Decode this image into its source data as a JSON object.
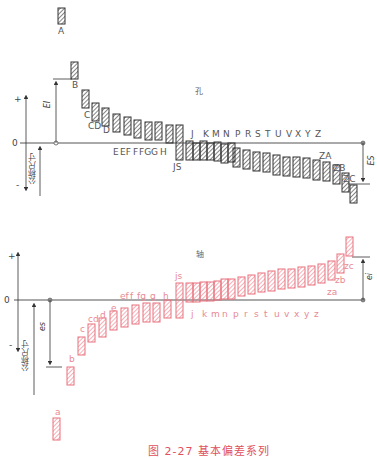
{
  "caption": "图 2-27  基本偏差系列",
  "colors": {
    "hole": "#333333",
    "shaft": "#e8707c",
    "axis": "#444444"
  },
  "hole_section": {
    "title": "孔",
    "zero_label": "0",
    "plus_label": "+",
    "minus_label": "-",
    "nominal_size_label": "公称尺寸",
    "EI_label": "EI",
    "ES_label": "ES",
    "zero_line_y": 143,
    "labels": [
      {
        "text": "A",
        "x": 58,
        "y": 27
      },
      {
        "text": "B",
        "x": 72,
        "y": 81
      },
      {
        "text": "C",
        "x": 84,
        "y": 111
      },
      {
        "text": "CD",
        "x": 88,
        "y": 122
      },
      {
        "text": "D",
        "x": 103,
        "y": 126
      },
      {
        "text": "E",
        "x": 113,
        "y": 148
      },
      {
        "text": "EF",
        "x": 120,
        "y": 148
      },
      {
        "text": "F",
        "x": 133,
        "y": 148
      },
      {
        "text": "FG",
        "x": 139,
        "y": 148
      },
      {
        "text": "G",
        "x": 151,
        "y": 148
      },
      {
        "text": "H",
        "x": 160,
        "y": 148
      },
      {
        "text": "JS",
        "x": 173,
        "y": 163
      },
      {
        "text": "J",
        "x": 191,
        "y": 130
      },
      {
        "text": "K",
        "x": 203,
        "y": 130
      },
      {
        "text": "M",
        "x": 212,
        "y": 130
      },
      {
        "text": "N",
        "x": 223,
        "y": 130
      },
      {
        "text": "P",
        "x": 235,
        "y": 130
      },
      {
        "text": "R",
        "x": 245,
        "y": 130
      },
      {
        "text": "S",
        "x": 255,
        "y": 130
      },
      {
        "text": "T",
        "x": 265,
        "y": 130
      },
      {
        "text": "U",
        "x": 275,
        "y": 130
      },
      {
        "text": "V",
        "x": 286,
        "y": 130
      },
      {
        "text": "X",
        "x": 295,
        "y": 130
      },
      {
        "text": "Y",
        "x": 305,
        "y": 130
      },
      {
        "text": "Z",
        "x": 315,
        "y": 130
      },
      {
        "text": "ZA",
        "x": 319,
        "y": 152
      },
      {
        "text": "ZB",
        "x": 333,
        "y": 164
      },
      {
        "text": "ZC",
        "x": 343,
        "y": 175
      }
    ],
    "bars": [
      {
        "x": 58,
        "y1": 8,
        "y2": 24
      },
      {
        "x": 71,
        "y1": 62,
        "y2": 79
      },
      {
        "x": 82,
        "y1": 90,
        "y2": 108
      },
      {
        "x": 92,
        "y1": 103,
        "y2": 121
      },
      {
        "x": 102,
        "y1": 108,
        "y2": 126
      },
      {
        "x": 113,
        "y1": 114,
        "y2": 132
      },
      {
        "x": 124,
        "y1": 117,
        "y2": 135
      },
      {
        "x": 134,
        "y1": 120,
        "y2": 138
      },
      {
        "x": 145,
        "y1": 122,
        "y2": 140
      },
      {
        "x": 155,
        "y1": 122,
        "y2": 140
      },
      {
        "x": 166,
        "y1": 125,
        "y2": 143
      },
      {
        "x": 176,
        "y1": 125,
        "y2": 160
      },
      {
        "x": 186,
        "y1": 141,
        "y2": 160
      },
      {
        "x": 193,
        "y1": 143,
        "y2": 160
      },
      {
        "x": 200,
        "y1": 141,
        "y2": 160
      },
      {
        "x": 207,
        "y1": 143,
        "y2": 160
      },
      {
        "x": 214,
        "y1": 142,
        "y2": 161
      },
      {
        "x": 221,
        "y1": 144,
        "y2": 163
      },
      {
        "x": 228,
        "y1": 143,
        "y2": 162
      },
      {
        "x": 233,
        "y1": 148,
        "y2": 167
      },
      {
        "x": 243,
        "y1": 150,
        "y2": 169
      },
      {
        "x": 253,
        "y1": 152,
        "y2": 171
      },
      {
        "x": 263,
        "y1": 153,
        "y2": 172
      },
      {
        "x": 273,
        "y1": 155,
        "y2": 175
      },
      {
        "x": 283,
        "y1": 157,
        "y2": 176
      },
      {
        "x": 293,
        "y1": 157,
        "y2": 177
      },
      {
        "x": 303,
        "y1": 158,
        "y2": 178
      },
      {
        "x": 313,
        "y1": 160,
        "y2": 180
      },
      {
        "x": 323,
        "y1": 162,
        "y2": 181
      },
      {
        "x": 333,
        "y1": 165,
        "y2": 184
      },
      {
        "x": 342,
        "y1": 173,
        "y2": 192
      },
      {
        "x": 350,
        "y1": 185,
        "y2": 203
      }
    ]
  },
  "shaft_section": {
    "title": "轴",
    "zero_label": "0",
    "plus_label": "+",
    "minus_label": "-",
    "nominal_size_label": "公称尺寸",
    "es_label": "es",
    "ei_label": "ei",
    "zero_line_y": 300,
    "labels": [
      {
        "text": "a",
        "x": 55,
        "y": 408
      },
      {
        "text": "b",
        "x": 69,
        "y": 355
      },
      {
        "text": "c",
        "x": 80,
        "y": 325
      },
      {
        "text": "cd",
        "x": 88,
        "y": 315
      },
      {
        "text": "d",
        "x": 100,
        "y": 311
      },
      {
        "text": "e",
        "x": 111,
        "y": 304
      },
      {
        "text": "ef",
        "x": 120,
        "y": 292
      },
      {
        "text": "f",
        "x": 130,
        "y": 292
      },
      {
        "text": "fg",
        "x": 137,
        "y": 292
      },
      {
        "text": "g",
        "x": 150,
        "y": 292
      },
      {
        "text": "h",
        "x": 163,
        "y": 292
      },
      {
        "text": "js",
        "x": 175,
        "y": 272
      },
      {
        "text": "j",
        "x": 191,
        "y": 310
      },
      {
        "text": "k",
        "x": 202,
        "y": 310
      },
      {
        "text": "m",
        "x": 211,
        "y": 310
      },
      {
        "text": "n",
        "x": 222,
        "y": 310
      },
      {
        "text": "p",
        "x": 233,
        "y": 310
      },
      {
        "text": "r",
        "x": 244,
        "y": 310
      },
      {
        "text": "s",
        "x": 254,
        "y": 310
      },
      {
        "text": "t",
        "x": 264,
        "y": 310
      },
      {
        "text": "u",
        "x": 274,
        "y": 310
      },
      {
        "text": "v",
        "x": 284,
        "y": 310
      },
      {
        "text": "x",
        "x": 294,
        "y": 310
      },
      {
        "text": "y",
        "x": 304,
        "y": 310
      },
      {
        "text": "z",
        "x": 314,
        "y": 310
      },
      {
        "text": "za",
        "x": 327,
        "y": 288
      },
      {
        "text": "zb",
        "x": 335,
        "y": 276
      },
      {
        "text": "zc",
        "x": 344,
        "y": 262
      }
    ],
    "bars": [
      {
        "x": 53,
        "y1": 418,
        "y2": 440
      },
      {
        "x": 67,
        "y1": 367,
        "y2": 385
      },
      {
        "x": 78,
        "y1": 337,
        "y2": 355
      },
      {
        "x": 88,
        "y1": 324,
        "y2": 342
      },
      {
        "x": 99,
        "y1": 318,
        "y2": 337
      },
      {
        "x": 110,
        "y1": 311,
        "y2": 330
      },
      {
        "x": 121,
        "y1": 308,
        "y2": 327
      },
      {
        "x": 132,
        "y1": 305,
        "y2": 324
      },
      {
        "x": 143,
        "y1": 303,
        "y2": 322
      },
      {
        "x": 153,
        "y1": 303,
        "y2": 322
      },
      {
        "x": 164,
        "y1": 300,
        "y2": 318
      },
      {
        "x": 176,
        "y1": 283,
        "y2": 318
      },
      {
        "x": 186,
        "y1": 283,
        "y2": 302
      },
      {
        "x": 193,
        "y1": 283,
        "y2": 302
      },
      {
        "x": 200,
        "y1": 282,
        "y2": 301
      },
      {
        "x": 207,
        "y1": 282,
        "y2": 301
      },
      {
        "x": 214,
        "y1": 281,
        "y2": 300
      },
      {
        "x": 221,
        "y1": 279,
        "y2": 299
      },
      {
        "x": 228,
        "y1": 279,
        "y2": 299
      },
      {
        "x": 238,
        "y1": 277,
        "y2": 296
      },
      {
        "x": 248,
        "y1": 275,
        "y2": 294
      },
      {
        "x": 258,
        "y1": 273,
        "y2": 292
      },
      {
        "x": 268,
        "y1": 271,
        "y2": 291
      },
      {
        "x": 278,
        "y1": 269,
        "y2": 289
      },
      {
        "x": 288,
        "y1": 269,
        "y2": 288
      },
      {
        "x": 298,
        "y1": 267,
        "y2": 287
      },
      {
        "x": 308,
        "y1": 266,
        "y2": 285
      },
      {
        "x": 318,
        "y1": 264,
        "y2": 283
      },
      {
        "x": 328,
        "y1": 261,
        "y2": 280
      },
      {
        "x": 337,
        "y1": 254,
        "y2": 273
      },
      {
        "x": 346,
        "y1": 237,
        "y2": 256
      }
    ]
  }
}
